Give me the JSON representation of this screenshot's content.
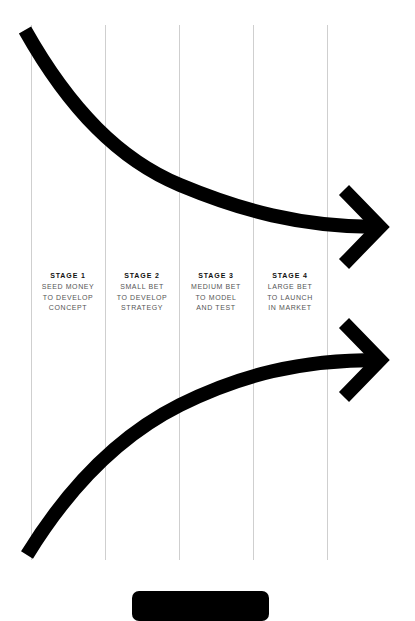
{
  "diagram": {
    "colors": {
      "background": "#ffffff",
      "arrow": "#000000",
      "divider": "#cfcfcf",
      "title_text": "#111111",
      "body_text": "#555555"
    },
    "stages": [
      {
        "title": "STAGE 1",
        "lines": [
          "SEED MONEY",
          "TO DEVELOP",
          "CONCEPT"
        ]
      },
      {
        "title": "STAGE 2",
        "lines": [
          "SMALL BET",
          "TO DEVELOP",
          "STRATEGY"
        ]
      },
      {
        "title": "STAGE 3",
        "lines": [
          "MEDIUM BET",
          "TO MODEL",
          "AND TEST"
        ]
      },
      {
        "title": "STAGE 4",
        "lines": [
          "LARGE BET",
          "TO LAUNCH",
          "IN MARKET"
        ]
      }
    ],
    "arrows": [
      {
        "name": "descending-arrow",
        "direction": "right",
        "shape": "curve-down"
      },
      {
        "name": "ascending-arrow",
        "direction": "right",
        "shape": "curve-up"
      }
    ]
  },
  "footer": {
    "button_label": ""
  }
}
